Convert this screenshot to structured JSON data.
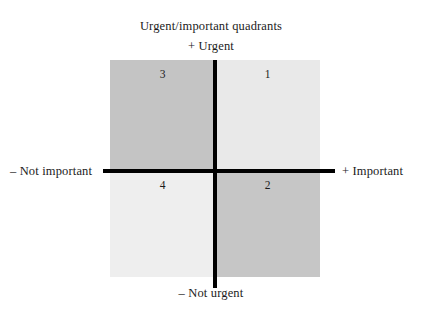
{
  "figure": {
    "title": "Urgent/important quadrants",
    "axes": {
      "top": "+ Urgent",
      "bottom": "– Not urgent",
      "left": "– Not important",
      "right": "+ Important"
    },
    "quadrants": [
      {
        "id": "q3",
        "label": "3",
        "position": "top-left",
        "urgency": "urgent",
        "importance": "not important",
        "fill": "#c4c4c4"
      },
      {
        "id": "q1",
        "label": "1",
        "position": "top-right",
        "urgency": "urgent",
        "importance": "important",
        "fill": "#e9e9e9"
      },
      {
        "id": "q4",
        "label": "4",
        "position": "bottom-left",
        "urgency": "not urgent",
        "importance": "not important",
        "fill": "#eeeeee"
      },
      {
        "id": "q2",
        "label": "2",
        "position": "bottom-right",
        "urgency": "not urgent",
        "importance": "important",
        "fill": "#c6c6c6"
      }
    ]
  },
  "chart_data": {
    "type": "scatter",
    "title": "Urgent/important quadrants",
    "xlabel": "",
    "ylabel": "",
    "grid": false,
    "legend": "none",
    "x_axis": {
      "negative": "– Not important",
      "positive": "+ Important"
    },
    "y_axis": {
      "negative": "– Not urgent",
      "positive": "+ Urgent"
    },
    "categories": [
      "1",
      "2",
      "3",
      "4"
    ],
    "annotations": [
      {
        "text": "1",
        "quadrant": "top-right",
        "x": 1,
        "y": 1
      },
      {
        "text": "2",
        "quadrant": "bottom-right",
        "x": 1,
        "y": -1
      },
      {
        "text": "3",
        "quadrant": "top-left",
        "x": -1,
        "y": 1
      },
      {
        "text": "4",
        "quadrant": "bottom-left",
        "x": -1,
        "y": -1
      }
    ]
  },
  "colors": {
    "axis": "#000000",
    "text": "#1b1b1b",
    "background": "#ffffff"
  }
}
